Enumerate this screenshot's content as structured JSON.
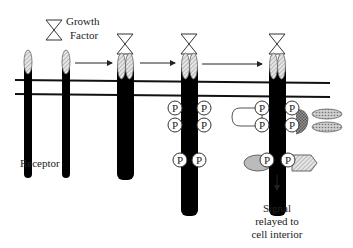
{
  "diagram": {
    "type": "receptor-tyrosine-kinase-signaling",
    "labels": {
      "growth_factor_line1": "Growth",
      "growth_factor_line2": "Factor",
      "receptor": "Receptor",
      "signal_line1": "Signal",
      "signal_line2": "relayed to",
      "signal_line3": "cell interior"
    },
    "phosphate_label": "P",
    "colors": {
      "receptor": "#000000",
      "membrane": "#111111",
      "ligand_stroke": "#333333",
      "hatched_fill": "#cccccc",
      "adaptor_fill": "#bbbbbb",
      "background": "#ffffff"
    },
    "stages": [
      {
        "name": "monomers",
        "description": "Two separate receptors with growth factor nearby"
      },
      {
        "name": "dimerized",
        "description": "Growth factor binds; receptors dimerize"
      },
      {
        "name": "phosphorylated",
        "description": "Tyrosine residues autophosphorylated (6 P)"
      },
      {
        "name": "signaling",
        "description": "Signaling proteins bind phosphotyrosines; signal relayed"
      }
    ]
  }
}
